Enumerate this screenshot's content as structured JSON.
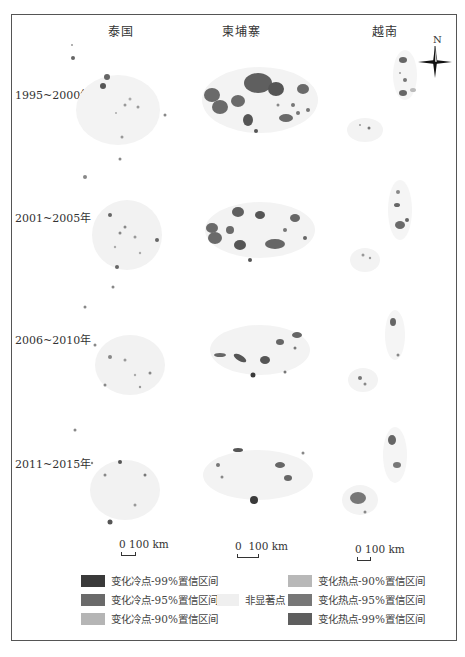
{
  "figure": {
    "columns": [
      {
        "label": "泰国"
      },
      {
        "label": "柬埔寨"
      },
      {
        "label": "越南"
      }
    ],
    "rows": [
      {
        "label": "1995~2000年"
      },
      {
        "label": "2001~2005年"
      },
      {
        "label": "2006~2010年"
      },
      {
        "label": "2011~2015年"
      }
    ],
    "compass": {
      "label": "N"
    },
    "scalebars": [
      {
        "zero": "0",
        "value": "100 km"
      },
      {
        "zero": "0",
        "value": "100 km"
      },
      {
        "zero": "0",
        "value": "100 km"
      }
    ]
  },
  "legend": {
    "cold": [
      {
        "label": "变化冷点-99%置信区间",
        "color": "#3a3a3a"
      },
      {
        "label": "变化冷点-95%置信区间",
        "color": "#6a6a6a"
      },
      {
        "label": "变化冷点-90%置信区间",
        "color": "#b5b5b5"
      }
    ],
    "not_significant": {
      "label": "非显著点",
      "color": "#efefef"
    },
    "hot": [
      {
        "label": "变化热点-90%置信区间",
        "color": "#b8b8b8"
      },
      {
        "label": "变化热点-95%置信区间",
        "color": "#777777"
      },
      {
        "label": "变化热点-99%置信区间",
        "color": "#5e5e5e"
      }
    ]
  },
  "colors": {
    "background_region": "#f3f3f3",
    "cold99": "#3a3a3a",
    "cold95": "#6a6a6a",
    "hot95": "#777777",
    "hot99": "#5e5e5e",
    "light": "#b5b5b5"
  }
}
